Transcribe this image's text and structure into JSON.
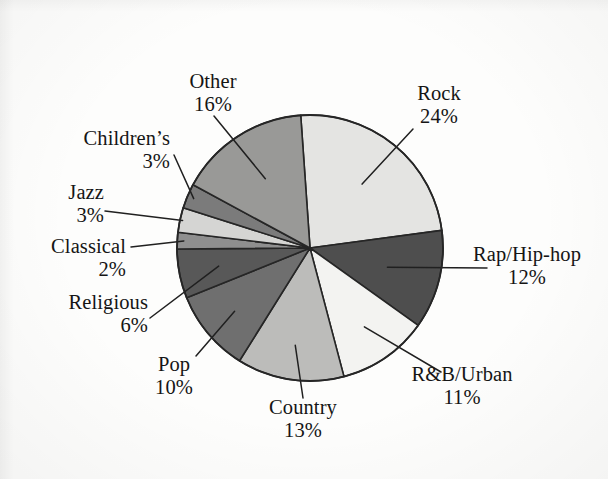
{
  "chart_data": {
    "type": "pie",
    "title": "",
    "subtitle": "",
    "xlabel": "",
    "ylabel": "",
    "legend_position": "none",
    "grid": false,
    "units": "percent",
    "total": 100,
    "start_angle_deg": -94,
    "direction": "clockwise",
    "categories": [
      "Rock",
      "Rap/Hip-hop",
      "R&B/Urban",
      "Country",
      "Pop",
      "Religious",
      "Classical",
      "Jazz",
      "Children’s",
      "Other"
    ],
    "values": [
      24,
      12,
      11,
      13,
      10,
      6,
      2,
      3,
      3,
      16
    ],
    "slices": [
      {
        "label": "Rock",
        "value": 24,
        "pct_text": "24%",
        "color": "#e4e4e2"
      },
      {
        "label": "Rap/Hip-hop",
        "value": 12,
        "pct_text": "12%",
        "color": "#4e4e4e"
      },
      {
        "label": "R&B/Urban",
        "value": 11,
        "pct_text": "11%",
        "color": "#f3f3f1"
      },
      {
        "label": "Country",
        "value": 13,
        "pct_text": "13%",
        "color": "#bcbcba"
      },
      {
        "label": "Pop",
        "value": 10,
        "pct_text": "10%",
        "color": "#6f6f6f"
      },
      {
        "label": "Religious",
        "value": 6,
        "pct_text": "6%",
        "color": "#585858"
      },
      {
        "label": "Classical",
        "value": 2,
        "pct_text": "2%",
        "color": "#8f8f8f"
      },
      {
        "label": "Jazz",
        "value": 3,
        "pct_text": "3%",
        "color": "#d5d5d3"
      },
      {
        "label": "Children’s",
        "value": 3,
        "pct_text": "3%",
        "color": "#7b7b7b"
      },
      {
        "label": "Other",
        "value": 16,
        "pct_text": "16%",
        "color": "#999997"
      }
    ]
  },
  "labels": {
    "rock": {
      "name": "Rock",
      "pct": "24%"
    },
    "rap": {
      "name": "Rap/Hip-hop",
      "pct": "12%"
    },
    "rnb": {
      "name": "R&B/Urban",
      "pct": "11%"
    },
    "country": {
      "name": "Country",
      "pct": "13%"
    },
    "pop": {
      "name": "Pop",
      "pct": "10%"
    },
    "religious": {
      "name": "Religious",
      "pct": "6%"
    },
    "classical": {
      "name": "Classical",
      "pct": "2%"
    },
    "jazz": {
      "name": "Jazz",
      "pct": "3%"
    },
    "childrens": {
      "name": "Children’s",
      "pct": "3%"
    },
    "other": {
      "name": "Other",
      "pct": "16%"
    }
  },
  "colors": {
    "background": "#fdfdfc",
    "outline": "#262626",
    "text": "#151515"
  }
}
